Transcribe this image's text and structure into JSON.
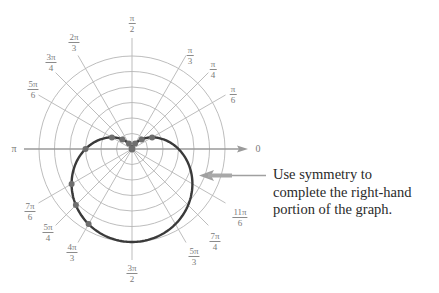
{
  "figure": {
    "note_lines": [
      "Use symmetry to",
      "complete the right-hand",
      "portion of the graph."
    ],
    "axis_labels": {
      "left": "π",
      "right": "0"
    }
  },
  "angle_labels": [
    {
      "id": "pi-over-2",
      "num": "π",
      "den": "2",
      "x": 132,
      "y": 24
    },
    {
      "id": "pi-over-3",
      "num": "π",
      "den": "3",
      "x": 190,
      "y": 56
    },
    {
      "id": "pi-over-4",
      "num": "π",
      "den": "4",
      "x": 213,
      "y": 70
    },
    {
      "id": "pi-over-6",
      "num": "π",
      "den": "6",
      "x": 233,
      "y": 95
    },
    {
      "id": "2pi-over-3",
      "num": "2π",
      "den": "3",
      "x": 74,
      "y": 43
    },
    {
      "id": "3pi-over-4",
      "num": "3π",
      "den": "4",
      "x": 51,
      "y": 63
    },
    {
      "id": "5pi-over-6",
      "num": "5π",
      "den": "6",
      "x": 33,
      "y": 90
    },
    {
      "id": "7pi-over-6",
      "num": "7π",
      "den": "6",
      "x": 30,
      "y": 212
    },
    {
      "id": "5pi-over-4",
      "num": "5π",
      "den": "4",
      "x": 48,
      "y": 233
    },
    {
      "id": "4pi-over-3",
      "num": "4π",
      "den": "3",
      "x": 72,
      "y": 253
    },
    {
      "id": "3pi-over-2",
      "num": "3π",
      "den": "2",
      "x": 132,
      "y": 274
    },
    {
      "id": "5pi-over-3",
      "num": "5π",
      "den": "3",
      "x": 194,
      "y": 257
    },
    {
      "id": "7pi-over-4",
      "num": "7π",
      "den": "4",
      "x": 215,
      "y": 242
    },
    {
      "id": "11pi-over-6",
      "num": "11π",
      "den": "6",
      "x": 240,
      "y": 218
    }
  ],
  "chart_data": {
    "type": "polar",
    "title": "",
    "equation": "r = 3 - 3 sin θ",
    "curve": {
      "a": 3,
      "b": -3,
      "trig": "sin"
    },
    "grid": {
      "circles": [
        1,
        2,
        3,
        4,
        5,
        6
      ],
      "rays_deg": [
        0,
        30,
        45,
        60,
        90,
        120,
        135,
        150,
        180,
        210,
        225,
        240,
        270,
        300,
        315,
        330
      ]
    },
    "plotted_points": [
      {
        "theta": "π/6",
        "r": 1.5
      },
      {
        "theta": "π/4",
        "r": 0.88
      },
      {
        "theta": "π/3",
        "r": 0.4
      },
      {
        "theta": "π/2",
        "r": 0
      },
      {
        "theta": "2π/3",
        "r": 0.4
      },
      {
        "theta": "3π/4",
        "r": 0.88
      },
      {
        "theta": "5π/6",
        "r": 1.5
      },
      {
        "theta": "π",
        "r": 3
      },
      {
        "theta": "7π/6",
        "r": 4.5
      },
      {
        "theta": "5π/4",
        "r": 5.12
      },
      {
        "theta": "4π/3",
        "r": 5.6
      }
    ],
    "points_deg": [
      30,
      45,
      60,
      90,
      120,
      135,
      150,
      180,
      210,
      225,
      240
    ],
    "annotation": "Use symmetry to complete the right-hand portion of the graph.",
    "colors": {
      "grid": "#b5b5b5",
      "curve": "#3a3a3a",
      "points": "#6e6e6e",
      "arrow": "#9a9a9a"
    }
  }
}
